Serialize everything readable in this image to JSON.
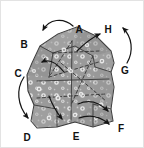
{
  "figure": {
    "background_color": "#ffffff",
    "frame_color": "#e3e3e3",
    "rock_fill_color": "#9b9b9b",
    "rock_fill_color_dark": "#8a8a8a",
    "rock_fill_color_light": "#aeaeae",
    "rock_outline_color": "#3a3a3a",
    "speckle_color": "#f2f2f2",
    "arrow_color": "#1a1a1a",
    "label_color": "#111111",
    "labels": [
      {
        "id": "A",
        "text": "A",
        "x": 78,
        "y": 29
      },
      {
        "id": "B",
        "text": "B",
        "x": 23,
        "y": 44
      },
      {
        "id": "C",
        "text": "C",
        "x": 17,
        "y": 73
      },
      {
        "id": "D",
        "text": "D",
        "x": 26,
        "y": 137
      },
      {
        "id": "E",
        "text": "E",
        "x": 75,
        "y": 136
      },
      {
        "id": "F",
        "text": "F",
        "x": 120,
        "y": 128
      },
      {
        "id": "G",
        "text": "G",
        "x": 124,
        "y": 70
      },
      {
        "id": "H",
        "text": "H",
        "x": 107,
        "y": 29
      }
    ],
    "arrow_count": 8,
    "speckle_count": 34
  }
}
